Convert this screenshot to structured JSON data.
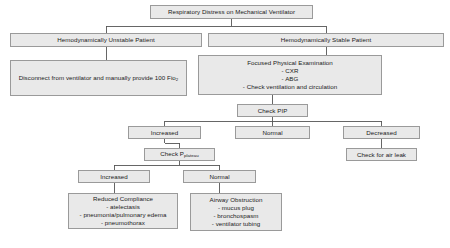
{
  "diagram": {
    "colors": {
      "box_fill": "#e9e9e9",
      "box_border": "#9a9a9a",
      "connector": "#555555",
      "text": "#1a1a1a",
      "background": "#ffffff"
    },
    "nodes": {
      "title": {
        "label": "Respiratory Distress on Mechanical Ventilator"
      },
      "unstable": {
        "label": "Hemodynamically Unstable Patient"
      },
      "stable": {
        "label": "Hemodynamically Stable Patient"
      },
      "disconnect": {
        "label_pre": "Disconnect from ventilator and manually provide 100 Fio",
        "label_sub": "2"
      },
      "focused": {
        "heading": "Focused Physical Examination",
        "item1": "- CXR",
        "item2": "- ABG",
        "item3": "- Check ventilation and circulation"
      },
      "check_pip": {
        "label": "Check PIP"
      },
      "increased_pip": {
        "label": "Increased"
      },
      "normal_pip": {
        "label": "Normal"
      },
      "decreased_pip": {
        "label": "Decreased"
      },
      "check_plateau": {
        "label_pre": "Check P",
        "label_sub": "plateau"
      },
      "air_leak": {
        "label": "Check for air leak"
      },
      "increased_plateau": {
        "label": "Increased"
      },
      "normal_plateau": {
        "label": "Normal"
      },
      "reduced_compliance": {
        "heading": "Reduced Compliance",
        "item1": "- atelectasis",
        "item2": "- pneumonia/pulmonary edema",
        "item3": "- pneumothorax"
      },
      "airway_obstruction": {
        "heading": "Airway Obstruction",
        "item1": "- mucus plug",
        "item2": "- bronchospasm",
        "item3": "- ventilator tubing"
      }
    }
  }
}
